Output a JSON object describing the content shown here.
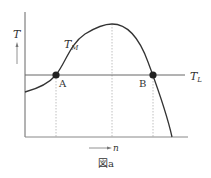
{
  "figure": {
    "caption": "図a",
    "y_axis_label": "T",
    "x_axis_label": "n",
    "curve_label": "T",
    "curve_label_sub": "M",
    "line_label": "T",
    "line_label_sub": "L",
    "points": [
      {
        "label": "A"
      },
      {
        "label": "B"
      }
    ]
  },
  "colors": {
    "curve": "#333333",
    "axis": "#555555",
    "line": "#555555",
    "dotted": "#aaaaaa",
    "point": "#222222"
  }
}
